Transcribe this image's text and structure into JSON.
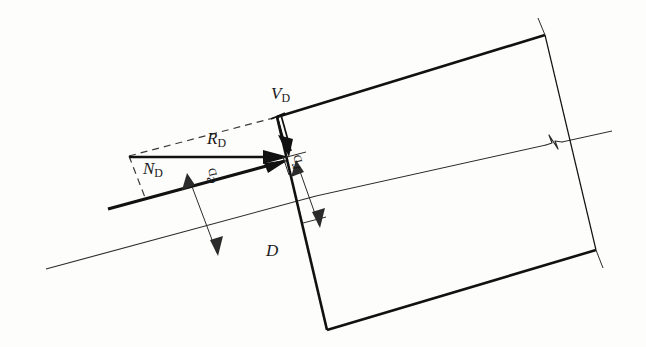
{
  "figure": {
    "kind": "engineering-force-diagram",
    "background_color": "#fdfdfb",
    "ink_color": "#1a1a1a",
    "labels": {
      "v_force": {
        "base": "V",
        "sub": "D",
        "name": "shear-force-label"
      },
      "r_force": {
        "base": "R",
        "sub": "D",
        "name": "resultant-force-label"
      },
      "n_force": {
        "base": "N",
        "sub": "D",
        "name": "normal-force-label"
      },
      "point_d": {
        "base": "D",
        "sub": "",
        "name": "point-d-label"
      },
      "eccentricity": {
        "base": "e",
        "sub": "D",
        "name": "eccentricity-dimension-label"
      },
      "radius": {
        "base": "r",
        "sub": "D",
        "name": "radius-dimension-label"
      }
    },
    "elements": {
      "member_outline": "inclined rectangular member",
      "centerline": "long thin axis line through member",
      "break_symbol": "z-jog break on centerline at right edge",
      "dashed_parallelogram": "force decomposition construction",
      "dimension_e": "double-headed dimension arrow for e_D",
      "dimension_r": "double-headed dimension arrow for r_D"
    }
  }
}
